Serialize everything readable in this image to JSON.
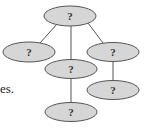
{
  "diagram": {
    "type": "tree",
    "node_fill": "#d6d6d6",
    "node_stroke": "#555555",
    "edge_color": "#555555",
    "nodes": [
      {
        "id": "root",
        "label": "?",
        "cx": 70,
        "cy": 16,
        "rx": 26,
        "ry": 10
      },
      {
        "id": "left",
        "label": "?",
        "cx": 29,
        "cy": 52,
        "rx": 26,
        "ry": 10
      },
      {
        "id": "middle",
        "label": "?",
        "cx": 71,
        "cy": 69,
        "rx": 26,
        "ry": 9.5
      },
      {
        "id": "right",
        "label": "?",
        "cx": 113,
        "cy": 52,
        "rx": 26,
        "ry": 9.5
      },
      {
        "id": "right-child",
        "label": "?",
        "cx": 113,
        "cy": 90,
        "rx": 26,
        "ry": 9.5
      },
      {
        "id": "bottom",
        "label": "?",
        "cx": 71,
        "cy": 112,
        "rx": 26,
        "ry": 9.5
      }
    ],
    "edges": [
      {
        "from": "root",
        "to": "left",
        "x1": 57,
        "y1": 24,
        "x2": 40,
        "y2": 43
      },
      {
        "from": "root",
        "to": "middle",
        "x1": 71,
        "y1": 26,
        "x2": 71,
        "y2": 60
      },
      {
        "from": "root",
        "to": "right",
        "x1": 88,
        "y1": 23,
        "x2": 103,
        "y2": 43
      },
      {
        "from": "middle",
        "to": "bottom",
        "x1": 71,
        "y1": 78,
        "x2": 71,
        "y2": 103
      },
      {
        "from": "right",
        "to": "right-child",
        "x1": 113,
        "y1": 61,
        "x2": 113,
        "y2": 81
      }
    ]
  },
  "text_fragment": "es."
}
